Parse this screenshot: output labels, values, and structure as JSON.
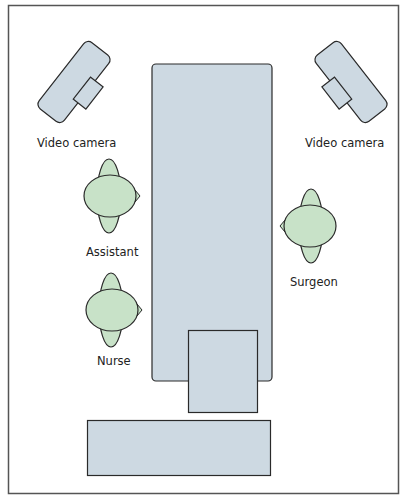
{
  "diagram": {
    "title": "",
    "colors": {
      "frame": "#555555",
      "equipment_fill": "#cdd9e2",
      "person_fill": "#c8e2c8",
      "outline": "#2a2a2a",
      "text": "#222222"
    },
    "labels": {
      "camera_left": "Video camera",
      "camera_right": "Video camera",
      "assistant": "Assistant",
      "surgeon": "Surgeon",
      "nurse": "Nurse"
    },
    "elements": [
      {
        "name": "operating-table",
        "type": "rect"
      },
      {
        "name": "instrument-tray",
        "type": "rect"
      },
      {
        "name": "side-table",
        "type": "rect"
      },
      {
        "name": "video-camera-left",
        "type": "camera"
      },
      {
        "name": "video-camera-right",
        "type": "camera"
      },
      {
        "name": "assistant",
        "type": "person",
        "facing": "right"
      },
      {
        "name": "surgeon",
        "type": "person",
        "facing": "left"
      },
      {
        "name": "nurse",
        "type": "person",
        "facing": "right"
      }
    ]
  }
}
